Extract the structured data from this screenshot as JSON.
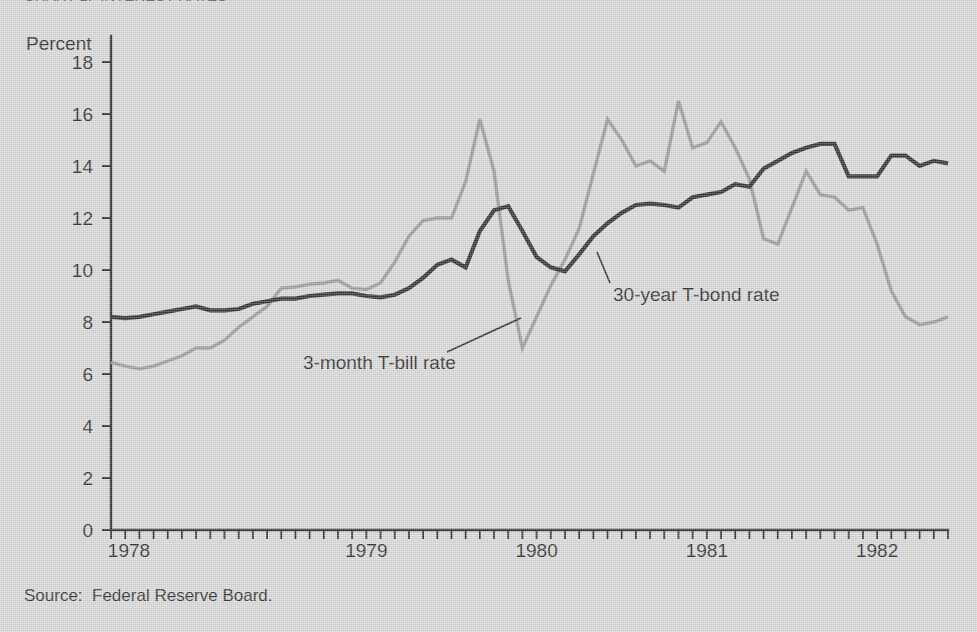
{
  "figure": {
    "cropped_header_text": "CHART 1.  INTEREST RATES",
    "source_note": "Source:  Federal Reserve Board.",
    "background_color": "#d5d5d5"
  },
  "chart_data": {
    "type": "line",
    "title": "",
    "xlabel": "",
    "ylabel": "Percent",
    "ylim": [
      0,
      19
    ],
    "xlim": [
      1978.0,
      1982.9166
    ],
    "grid": false,
    "legend": "inline-annotations",
    "y_ticks": [
      0,
      2,
      4,
      6,
      8,
      10,
      12,
      14,
      16,
      18
    ],
    "y_tick_labels": [
      "0",
      "2",
      "4",
      "6",
      "8",
      "10",
      "12",
      "14",
      "16",
      "18"
    ],
    "x_tick_labels": [
      "1978",
      "1979",
      "1980",
      "1981",
      "1982"
    ],
    "x_tick_label_years": [
      1978,
      1979,
      1980,
      1981,
      1982
    ],
    "x_minor_tick_interval": "monthly",
    "x_minor_tick_count": 60,
    "annotations": [
      {
        "name": "tbill-annotation",
        "text": "3-month T-bill rate",
        "label_x": 303,
        "label_y": 369,
        "leader_from_x": 447,
        "leader_from_y": 352,
        "leader_to_x": 521,
        "leader_to_y": 318
      },
      {
        "name": "tbond-annotation",
        "text": "30-year T-bond rate",
        "label_x": 613,
        "label_y": 301,
        "leader_from_x": 610,
        "leader_from_y": 283,
        "leader_to_x": 597,
        "leader_to_y": 252
      }
    ],
    "series": [
      {
        "name": "30-year T-bond rate",
        "key": "tbond",
        "color": "#141414",
        "x": [
          1978.0,
          1978.0833,
          1978.1667,
          1978.25,
          1978.3333,
          1978.4167,
          1978.5,
          1978.5833,
          1978.6667,
          1978.75,
          1978.8333,
          1978.9167,
          1979.0,
          1979.0833,
          1979.1667,
          1979.25,
          1979.3333,
          1979.4167,
          1979.5,
          1979.5833,
          1979.6667,
          1979.75,
          1979.8333,
          1979.9167,
          1980.0,
          1980.0833,
          1980.1667,
          1980.25,
          1980.3333,
          1980.4167,
          1980.5,
          1980.5833,
          1980.6667,
          1980.75,
          1980.8333,
          1980.9167,
          1981.0,
          1981.0833,
          1981.1667,
          1981.25,
          1981.3333,
          1981.4167,
          1981.5,
          1981.5833,
          1981.6667,
          1981.75,
          1981.8333,
          1981.9167,
          1982.0,
          1982.0833,
          1982.1667,
          1982.25,
          1982.3333,
          1982.4167,
          1982.5,
          1982.5833,
          1982.6667,
          1982.75,
          1982.8333,
          1982.9167
        ],
        "values": [
          8.2,
          8.15,
          8.2,
          8.3,
          8.4,
          8.5,
          8.6,
          8.45,
          8.45,
          8.5,
          8.7,
          8.8,
          8.9,
          8.9,
          9.0,
          9.05,
          9.1,
          9.1,
          9.0,
          8.95,
          9.05,
          9.3,
          9.7,
          10.2,
          10.4,
          10.1,
          11.5,
          12.3,
          12.45,
          11.5,
          10.5,
          10.1,
          9.95,
          10.6,
          11.3,
          11.8,
          12.2,
          12.5,
          12.55,
          12.5,
          12.4,
          12.8,
          12.9,
          13.0,
          13.3,
          13.2,
          13.9,
          14.2,
          14.5,
          14.7,
          14.85,
          14.85,
          13.6,
          13.6,
          13.6,
          14.4,
          14.4,
          14.0,
          14.2,
          14.1
        ],
        "values_tail": [
          13.4,
          12.6,
          11.3,
          10.7,
          10.65
        ]
      },
      {
        "name": "3-month T-bill rate",
        "key": "tbill",
        "color": "#8f8f8f",
        "x": [
          1978.0,
          1978.0833,
          1978.1667,
          1978.25,
          1978.3333,
          1978.4167,
          1978.5,
          1978.5833,
          1978.6667,
          1978.75,
          1978.8333,
          1978.9167,
          1979.0,
          1979.0833,
          1979.1667,
          1979.25,
          1979.3333,
          1979.4167,
          1979.5,
          1979.5833,
          1979.6667,
          1979.75,
          1979.8333,
          1979.9167,
          1980.0,
          1980.0833,
          1980.1667,
          1980.25,
          1980.3333,
          1980.4167,
          1980.5,
          1980.5833,
          1980.6667,
          1980.75,
          1980.8333,
          1980.9167,
          1981.0,
          1981.0833,
          1981.1667,
          1981.25,
          1981.3333,
          1981.4167,
          1981.5,
          1981.5833,
          1981.6667,
          1981.75,
          1981.8333,
          1981.9167,
          1982.0,
          1982.0833,
          1982.1667,
          1982.25,
          1982.3333,
          1982.4167,
          1982.5,
          1982.5833,
          1982.6667,
          1982.75,
          1982.8333,
          1982.9167
        ],
        "values": [
          6.45,
          6.3,
          6.2,
          6.3,
          6.5,
          6.7,
          7.0,
          7.0,
          7.3,
          7.8,
          8.2,
          8.6,
          9.3,
          9.35,
          9.45,
          9.5,
          9.6,
          9.3,
          9.25,
          9.5,
          10.3,
          11.3,
          11.9,
          12.0,
          12.0,
          13.4,
          15.8,
          13.8,
          9.6,
          7.0,
          8.2,
          9.4,
          10.4,
          11.6,
          13.7,
          15.8,
          15.0,
          14.0,
          14.2,
          13.8,
          16.5,
          14.7,
          14.9,
          15.7,
          14.7,
          13.5,
          11.2,
          11.0,
          12.4,
          13.8,
          12.9,
          12.8,
          12.3,
          12.4,
          11.0,
          9.2,
          8.2,
          7.9,
          8.0,
          8.2
        ]
      }
    ]
  },
  "layout": {
    "plot_left": 111,
    "plot_right": 948,
    "plot_top": 36,
    "plot_bottom": 530,
    "y_axis_label_x": 26,
    "y_axis_label_y": 50,
    "x_label_y": 557,
    "tick_len_major": 9,
    "tick_len_minor": 9
  }
}
